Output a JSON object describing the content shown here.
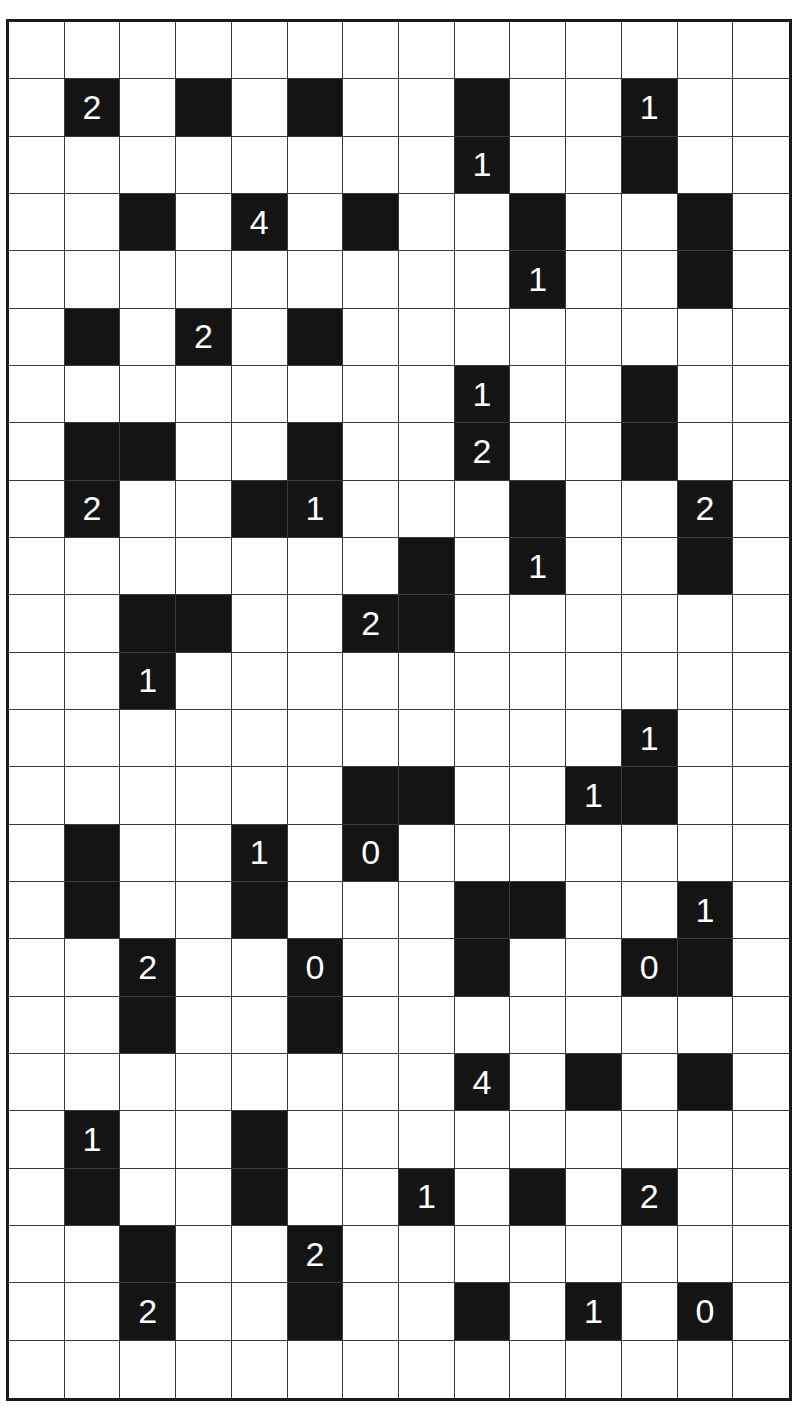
{
  "puzzle": {
    "type": "light-up",
    "rows": 24,
    "cols": 14,
    "colors": {
      "black": "#141414",
      "white": "#ffffff",
      "clue_text": "#ffffff",
      "grid_line": "#3a3a3a"
    },
    "black_cells": [
      {
        "r": 1,
        "c": 1,
        "clue": "2"
      },
      {
        "r": 1,
        "c": 3,
        "clue": ""
      },
      {
        "r": 1,
        "c": 5,
        "clue": ""
      },
      {
        "r": 1,
        "c": 8,
        "clue": ""
      },
      {
        "r": 1,
        "c": 11,
        "clue": "1"
      },
      {
        "r": 2,
        "c": 8,
        "clue": "1"
      },
      {
        "r": 2,
        "c": 11,
        "clue": ""
      },
      {
        "r": 3,
        "c": 2,
        "clue": ""
      },
      {
        "r": 3,
        "c": 4,
        "clue": "4"
      },
      {
        "r": 3,
        "c": 6,
        "clue": ""
      },
      {
        "r": 3,
        "c": 9,
        "clue": ""
      },
      {
        "r": 3,
        "c": 12,
        "clue": ""
      },
      {
        "r": 4,
        "c": 9,
        "clue": "1"
      },
      {
        "r": 4,
        "c": 12,
        "clue": ""
      },
      {
        "r": 5,
        "c": 1,
        "clue": ""
      },
      {
        "r": 5,
        "c": 3,
        "clue": "2"
      },
      {
        "r": 5,
        "c": 5,
        "clue": ""
      },
      {
        "r": 6,
        "c": 8,
        "clue": "1"
      },
      {
        "r": 6,
        "c": 11,
        "clue": ""
      },
      {
        "r": 7,
        "c": 1,
        "clue": ""
      },
      {
        "r": 7,
        "c": 2,
        "clue": ""
      },
      {
        "r": 7,
        "c": 5,
        "clue": ""
      },
      {
        "r": 7,
        "c": 8,
        "clue": "2"
      },
      {
        "r": 7,
        "c": 11,
        "clue": ""
      },
      {
        "r": 8,
        "c": 1,
        "clue": "2"
      },
      {
        "r": 8,
        "c": 4,
        "clue": ""
      },
      {
        "r": 8,
        "c": 5,
        "clue": "1"
      },
      {
        "r": 8,
        "c": 9,
        "clue": ""
      },
      {
        "r": 8,
        "c": 12,
        "clue": "2"
      },
      {
        "r": 9,
        "c": 7,
        "clue": ""
      },
      {
        "r": 9,
        "c": 9,
        "clue": "1"
      },
      {
        "r": 9,
        "c": 12,
        "clue": ""
      },
      {
        "r": 10,
        "c": 2,
        "clue": ""
      },
      {
        "r": 10,
        "c": 3,
        "clue": ""
      },
      {
        "r": 10,
        "c": 6,
        "clue": "2"
      },
      {
        "r": 10,
        "c": 7,
        "clue": ""
      },
      {
        "r": 11,
        "c": 2,
        "clue": "1"
      },
      {
        "r": 12,
        "c": 11,
        "clue": "1"
      },
      {
        "r": 13,
        "c": 6,
        "clue": ""
      },
      {
        "r": 13,
        "c": 7,
        "clue": ""
      },
      {
        "r": 13,
        "c": 10,
        "clue": "1"
      },
      {
        "r": 13,
        "c": 11,
        "clue": ""
      },
      {
        "r": 14,
        "c": 1,
        "clue": ""
      },
      {
        "r": 14,
        "c": 4,
        "clue": "1"
      },
      {
        "r": 14,
        "c": 6,
        "clue": "0"
      },
      {
        "r": 15,
        "c": 1,
        "clue": ""
      },
      {
        "r": 15,
        "c": 4,
        "clue": ""
      },
      {
        "r": 15,
        "c": 8,
        "clue": ""
      },
      {
        "r": 15,
        "c": 9,
        "clue": ""
      },
      {
        "r": 15,
        "c": 12,
        "clue": "1"
      },
      {
        "r": 16,
        "c": 2,
        "clue": "2"
      },
      {
        "r": 16,
        "c": 5,
        "clue": "0"
      },
      {
        "r": 16,
        "c": 8,
        "clue": ""
      },
      {
        "r": 16,
        "c": 11,
        "clue": "0"
      },
      {
        "r": 16,
        "c": 12,
        "clue": ""
      },
      {
        "r": 17,
        "c": 2,
        "clue": ""
      },
      {
        "r": 17,
        "c": 5,
        "clue": ""
      },
      {
        "r": 18,
        "c": 8,
        "clue": "4"
      },
      {
        "r": 18,
        "c": 10,
        "clue": ""
      },
      {
        "r": 18,
        "c": 12,
        "clue": ""
      },
      {
        "r": 19,
        "c": 1,
        "clue": "1"
      },
      {
        "r": 19,
        "c": 4,
        "clue": ""
      },
      {
        "r": 20,
        "c": 1,
        "clue": ""
      },
      {
        "r": 20,
        "c": 4,
        "clue": ""
      },
      {
        "r": 20,
        "c": 7,
        "clue": "1"
      },
      {
        "r": 20,
        "c": 9,
        "clue": ""
      },
      {
        "r": 20,
        "c": 11,
        "clue": "2"
      },
      {
        "r": 21,
        "c": 2,
        "clue": ""
      },
      {
        "r": 21,
        "c": 5,
        "clue": "2"
      },
      {
        "r": 22,
        "c": 2,
        "clue": "2"
      },
      {
        "r": 22,
        "c": 5,
        "clue": ""
      },
      {
        "r": 22,
        "c": 8,
        "clue": ""
      },
      {
        "r": 22,
        "c": 10,
        "clue": "1"
      },
      {
        "r": 22,
        "c": 12,
        "clue": "0"
      }
    ]
  }
}
